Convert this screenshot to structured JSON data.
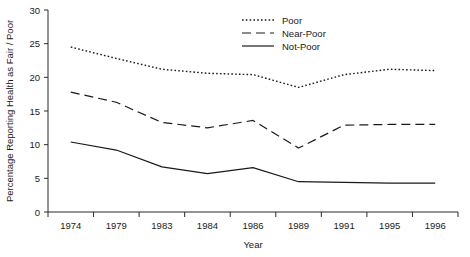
{
  "chart_data": {
    "type": "line",
    "title": "",
    "xlabel": "Year",
    "ylabel": "Percentage Reporting Health as Fair / Poor",
    "categories": [
      "1974",
      "1979",
      "1983",
      "1984",
      "1986",
      "1989",
      "1991",
      "1995",
      "1996"
    ],
    "x_tick_labels": [
      "1974",
      "1979",
      "1983",
      "1984",
      "1986",
      "1989",
      "1991",
      "1995",
      "1996"
    ],
    "y_tick_labels": [
      "0",
      "5",
      "10",
      "15",
      "20",
      "25",
      "30"
    ],
    "y_ticks": [
      0,
      5,
      10,
      15,
      20,
      25,
      30
    ],
    "ylim": [
      0,
      30
    ],
    "grid": false,
    "legend_position": "top-center",
    "series": [
      {
        "name": "Poor",
        "style": "dotted",
        "values": [
          24.5,
          22.8,
          21.2,
          20.6,
          20.4,
          18.5,
          20.4,
          21.2,
          21.0
        ]
      },
      {
        "name": "Near-Poor",
        "style": "dashed",
        "values": [
          17.8,
          16.3,
          13.3,
          12.5,
          13.6,
          9.5,
          12.9,
          13.0,
          13.0
        ]
      },
      {
        "name": "Not-Poor",
        "style": "solid",
        "values": [
          10.4,
          9.2,
          6.7,
          5.7,
          6.6,
          4.5,
          4.4,
          4.3,
          4.3
        ]
      }
    ]
  },
  "legend": {
    "items": [
      {
        "label": "Poor",
        "style": "dotted"
      },
      {
        "label": "Near-Poor",
        "style": "dashed"
      },
      {
        "label": "Not-Poor",
        "style": "solid"
      }
    ]
  },
  "axes": {
    "x_title": "Year",
    "y_title": "Percentage Reporting Health as Fair / Poor"
  }
}
